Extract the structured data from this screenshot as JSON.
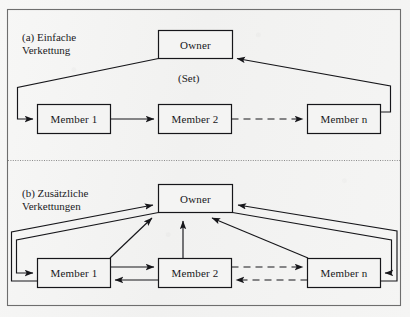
{
  "figure": {
    "title_caption_a": "(a) Einfache\nVerkettung",
    "title_caption_b": "(b) Zusätzliche\nVerkettungen",
    "set_label": "(Set)",
    "ink_color": "#16161a",
    "paper_color": "#f4f4f3"
  },
  "panel_a": {
    "caption": "(a) Einfache\nVerkettung",
    "set_label": "(Set)",
    "owner": "Owner",
    "members": [
      {
        "label": "Member 1"
      },
      {
        "label": "Member 2"
      },
      {
        "label": "Member  n"
      }
    ],
    "edges": [
      {
        "from": "owner",
        "to": "member-1",
        "style": "solid",
        "arrow": "single"
      },
      {
        "from": "member-1",
        "to": "member-2",
        "style": "solid",
        "arrow": "single"
      },
      {
        "from": "member-2",
        "to": "member-n",
        "style": "dashed",
        "arrow": "single"
      },
      {
        "from": "member-n",
        "to": "owner",
        "style": "solid",
        "arrow": "single"
      }
    ]
  },
  "panel_b": {
    "caption": "(b) Zusätzliche\nVerkettungen",
    "owner": "Owner",
    "members": [
      {
        "label": "Member 1"
      },
      {
        "label": "Member 2"
      },
      {
        "label": "Member  n"
      }
    ],
    "edges": [
      {
        "from": "owner",
        "to": "member-1",
        "style": "solid",
        "arrow": "single"
      },
      {
        "from": "owner",
        "to": "member-n",
        "style": "solid",
        "arrow": "single"
      },
      {
        "from": "member-1",
        "to": "owner",
        "style": "solid",
        "arrow": "single"
      },
      {
        "from": "member-2",
        "to": "owner",
        "style": "solid",
        "arrow": "single"
      },
      {
        "from": "member-n",
        "to": "owner",
        "style": "solid",
        "arrow": "single"
      },
      {
        "from": "member-1",
        "to": "member-2",
        "style": "solid",
        "arrow": "single"
      },
      {
        "from": "member-2",
        "to": "member-1",
        "style": "solid",
        "arrow": "single"
      },
      {
        "from": "member-2",
        "to": "member-n",
        "style": "dashed",
        "arrow": "single"
      },
      {
        "from": "member-n",
        "to": "member-2",
        "style": "dashed",
        "arrow": "single"
      }
    ]
  }
}
